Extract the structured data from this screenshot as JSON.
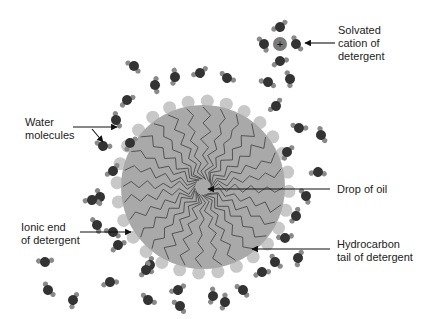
{
  "labels": {
    "solvated_cation": "Solvated\ncation of\ndetergent",
    "water_molecules": "Water\nmolecules",
    "drop_of_oil": "Drop of oil",
    "ionic_end": "Ionic end\nof detergent",
    "hydrocarbon_tail": "Hydrocarbon\ntail of detergent"
  },
  "cation_symbol": "+",
  "colors": {
    "oil_drop": "#a9a9a9",
    "ionic_head": "#c8c8c8",
    "tail_line": "#555555",
    "oxygen": "#333333",
    "hydrogen": "#8a8a8a",
    "cation": "#7a7a7a",
    "arrow": "#111111"
  }
}
